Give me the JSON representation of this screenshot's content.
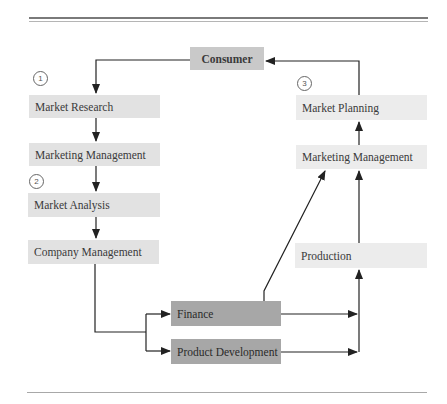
{
  "diagram": {
    "type": "flowchart",
    "nodes": {
      "consumer": "Consumer",
      "market_research": "Market Research",
      "marketing_management_left": "Marketing Management",
      "market_analysis": "Market Analysis",
      "company_management": "Company Management",
      "finance": "Finance",
      "product_development": "Product Development",
      "production": "Production",
      "marketing_management_right": "Marketing Management",
      "market_planning": "Market Planning"
    },
    "step_markers": [
      "1",
      "2",
      "3"
    ],
    "edges": [
      [
        "Consumer",
        "Market Research"
      ],
      [
        "Market Research",
        "Marketing Management (left)"
      ],
      [
        "Marketing Management (left)",
        "Market Analysis"
      ],
      [
        "Market Analysis",
        "Company Management"
      ],
      [
        "Company Management",
        "Finance"
      ],
      [
        "Company Management",
        "Product Development"
      ],
      [
        "Finance",
        "Production"
      ],
      [
        "Product Development",
        "Production"
      ],
      [
        "Finance",
        "Marketing Management (right)"
      ],
      [
        "Production",
        "Marketing Management (right)"
      ],
      [
        "Marketing Management (right)",
        "Market Planning"
      ],
      [
        "Market Planning",
        "Consumer"
      ]
    ]
  }
}
